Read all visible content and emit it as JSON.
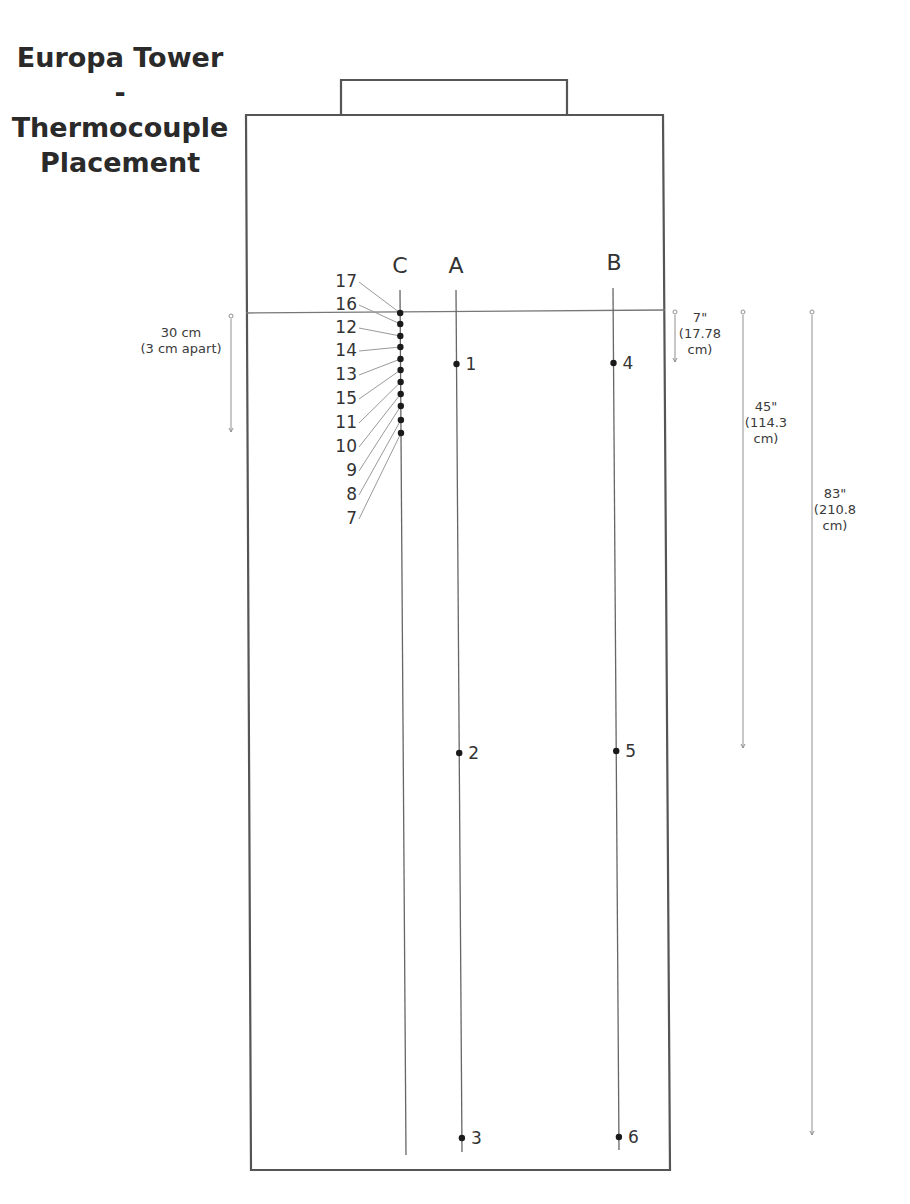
{
  "title": {
    "line1": "Europa Tower",
    "line2": "-",
    "line3": "Thermocouple",
    "line4": "Placement"
  },
  "tower": {
    "outer_box": {
      "x1": 246,
      "y1": 115,
      "x2": 666,
      "y2": 1170
    },
    "top_cap": {
      "x1": 341,
      "y1": 80,
      "x2": 567,
      "y2": 115
    },
    "reference_line_y": 311
  },
  "columns": [
    {
      "id": "C",
      "label": "C",
      "label_x": 400,
      "label_y": 273,
      "x_top": 400,
      "x_bottom": 406,
      "y_top": 290,
      "y_bottom": 1155
    },
    {
      "id": "A",
      "label": "A",
      "label_x": 456,
      "label_y": 273,
      "x_top": 456,
      "x_bottom": 462,
      "y_top": 290,
      "y_bottom": 1152
    },
    {
      "id": "B",
      "label": "B",
      "label_x": 614,
      "label_y": 270,
      "x_top": 613,
      "x_bottom": 619,
      "y_top": 288,
      "y_bottom": 1150
    }
  ],
  "sensors_column_A": [
    {
      "num": "1",
      "y": 364
    },
    {
      "num": "2",
      "y": 753
    },
    {
      "num": "3",
      "y": 1138
    }
  ],
  "sensors_column_B": [
    {
      "num": "4",
      "y": 363
    },
    {
      "num": "5",
      "y": 751
    },
    {
      "num": "6",
      "y": 1137
    }
  ],
  "sensors_column_C": {
    "label_x": 357,
    "items": [
      {
        "num": "17",
        "label_y": 287,
        "dot_y": 313
      },
      {
        "num": "16",
        "label_y": 310,
        "dot_y": 324
      },
      {
        "num": "12",
        "label_y": 333,
        "dot_y": 336
      },
      {
        "num": "14",
        "label_y": 356,
        "dot_y": 347
      },
      {
        "num": "13",
        "label_y": 380,
        "dot_y": 359
      },
      {
        "num": "15",
        "label_y": 404,
        "dot_y": 370
      },
      {
        "num": "11",
        "label_y": 428,
        "dot_y": 382
      },
      {
        "num": "10",
        "label_y": 452,
        "dot_y": 394
      },
      {
        "num": "9",
        "label_y": 476,
        "dot_y": 406
      },
      {
        "num": "8",
        "label_y": 500,
        "dot_y": 420
      },
      {
        "num": "7",
        "label_y": 524,
        "dot_y": 433
      }
    ]
  },
  "dimensions": [
    {
      "id": "dim-30cm",
      "x": 231,
      "y1": 316,
      "y2": 432,
      "lines": [
        "30 cm",
        "(3 cm apart)"
      ],
      "text_x": 181,
      "text_y": 337,
      "anchor": "middle"
    },
    {
      "id": "dim-7in",
      "x": 675,
      "y1": 312,
      "y2": 362,
      "lines": [
        "7\"",
        "(17.78",
        "cm)"
      ],
      "text_x": 700,
      "text_y": 322,
      "anchor": "middle"
    },
    {
      "id": "dim-45in",
      "x": 743,
      "y1": 312,
      "y2": 748,
      "lines": [
        "45\"",
        "(114.3",
        "cm)"
      ],
      "text_x": 766,
      "text_y": 411,
      "anchor": "middle"
    },
    {
      "id": "dim-83in",
      "x": 812,
      "y1": 312,
      "y2": 1135,
      "lines": [
        "83\"",
        "(210.8",
        "cm)"
      ],
      "text_x": 835,
      "text_y": 498,
      "anchor": "middle"
    }
  ],
  "colors": {
    "box_stroke": "#555555",
    "probe_stroke": "#666666",
    "dot_fill": "#1a1a1a",
    "text": "#333333"
  }
}
